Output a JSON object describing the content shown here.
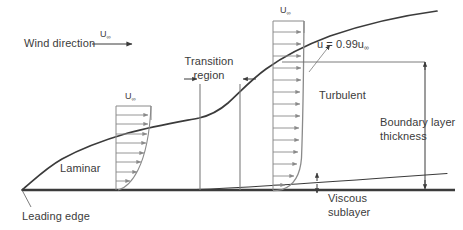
{
  "figure": {
    "background_color": "#ffffff",
    "line_color": "#3b3b3b",
    "profile_color": "#808080",
    "text_color": "#3b3b3b"
  },
  "labels": {
    "wind_direction": "Wind direction",
    "u_infinity_symbol": "U",
    "u_infinity_subscript": "∞",
    "transition_line1": "Transition",
    "transition_line2": "region",
    "laminar": "Laminar",
    "turbulent": "Turbulent",
    "leading_edge": "Leading edge",
    "boundary_layer_line1": "Boundary layer",
    "boundary_layer_line2": "thickness",
    "viscous_line1": "Viscous",
    "viscous_line2": "sublayer",
    "edge_definition_prefix": "u = 0.99u",
    "edge_definition_subscript": "∞"
  },
  "diagram_data": {
    "type": "diagram",
    "regions": [
      {
        "name": "Laminar",
        "x_start": 22,
        "x_end": 200
      },
      {
        "name": "Transition region",
        "x_start": 200,
        "x_end": 240
      },
      {
        "name": "Turbulent",
        "x_start": 240,
        "x_end": 455
      }
    ],
    "plate": {
      "x_start": 22,
      "x_end": 455,
      "y": 190
    },
    "leading_edge": {
      "x": 22,
      "y": 190
    },
    "velocity_profiles": [
      {
        "name": "laminar-profile",
        "x_left": 116,
        "x_right": 151,
        "y_top": 106,
        "y_bottom": 190,
        "arrow_count": 8,
        "label": "U∞"
      },
      {
        "name": "turbulent-profile",
        "x_left": 273,
        "x_right": 304,
        "y_top": 21,
        "y_bottom": 190,
        "arrow_count": 14,
        "label": "U∞"
      }
    ],
    "boundary_layer_curve_points": [
      [
        22,
        190
      ],
      [
        45,
        170
      ],
      [
        70,
        155
      ],
      [
        100,
        140
      ],
      [
        140,
        128
      ],
      [
        175,
        122
      ],
      [
        200,
        118
      ],
      [
        222,
        110
      ],
      [
        240,
        98
      ],
      [
        265,
        75
      ],
      [
        290,
        57
      ],
      [
        320,
        42
      ],
      [
        360,
        29
      ],
      [
        400,
        20
      ],
      [
        437,
        13
      ]
    ],
    "viscous_sublayer_curve_points": [
      [
        200,
        189
      ],
      [
        260,
        186
      ],
      [
        320,
        182
      ],
      [
        390,
        178
      ],
      [
        447,
        174
      ]
    ],
    "dimension_lines": [
      {
        "name": "boundary-layer-thickness",
        "x": 425,
        "y_top": 58,
        "y_bottom": 190,
        "arrowheads": "both"
      },
      {
        "name": "viscous-sublayer-thickness",
        "x": 317,
        "y_top": 173,
        "y_bottom": 192,
        "arrowheads": "both"
      },
      {
        "name": "transition-left-bound",
        "x": 200,
        "y_top": 84,
        "y_bottom": 190
      },
      {
        "name": "transition-right-bound",
        "x": 240,
        "y_top": 84,
        "y_bottom": 190
      }
    ],
    "wind_arrow": {
      "x_start": 92,
      "x_end": 136,
      "y": 44
    }
  }
}
